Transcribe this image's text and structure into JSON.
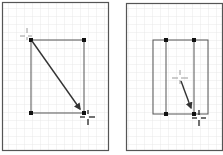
{
  "figure": {
    "colors": {
      "background": "#ffffff",
      "grid": "#e3e3e3",
      "frame": "#555555",
      "shape_stroke": "#555555",
      "handle": "#111111",
      "arrow": "#333333",
      "crosshair": "#9a9a9a",
      "crosshair_dark": "#111111"
    },
    "panels": [
      {
        "name": "before-drag",
        "action": "drag from top-left handle to bottom-right handle"
      },
      {
        "name": "after-drag",
        "action": "drag from center toward bottom handle of narrowed inner rectangle"
      }
    ]
  }
}
